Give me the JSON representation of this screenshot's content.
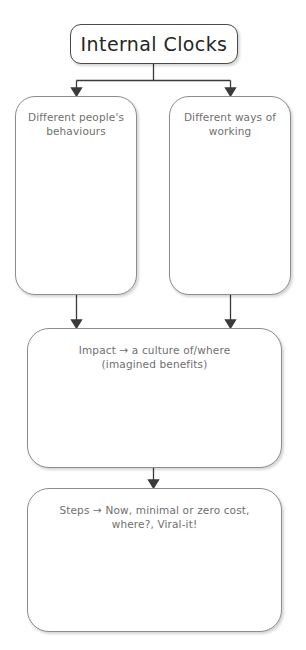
{
  "diagram": {
    "type": "flowchart",
    "title_node": {
      "id": "internal-clocks",
      "label": "Internal Clocks"
    },
    "nodes": [
      {
        "id": "different-people-behaviours",
        "label": "Different people's behaviours",
        "line1": "Different people's",
        "line2": "behaviours"
      },
      {
        "id": "different-ways-of-working",
        "label": "Different ways of working",
        "line1": "Different ways of",
        "line2": "working"
      },
      {
        "id": "impact",
        "label": "Impact → a culture of/where (imagined benefits)",
        "line1": "Impact → a culture of/where",
        "line2": "(imagined benefits)"
      },
      {
        "id": "steps",
        "label": "Steps → Now, minimal or zero cost, where?, Viral-it!",
        "line1": "Steps → Now, minimal or zero cost,",
        "line2": "where?, Viral-it!"
      }
    ],
    "edges": [
      {
        "from": "internal-clocks",
        "to": "different-people-behaviours"
      },
      {
        "from": "internal-clocks",
        "to": "different-ways-of-working"
      },
      {
        "from": "different-people-behaviours",
        "to": "impact"
      },
      {
        "from": "different-ways-of-working",
        "to": "impact"
      },
      {
        "from": "impact",
        "to": "steps"
      }
    ],
    "style": {
      "background": "#ffffff",
      "box_fill": "#ffffff",
      "box_border": "#8c8c8c",
      "title_border": "#4a4a4a",
      "title_text_color": "#262626",
      "body_text_color": "#6f6f6f",
      "connector_color": "#3a3a3a"
    }
  }
}
